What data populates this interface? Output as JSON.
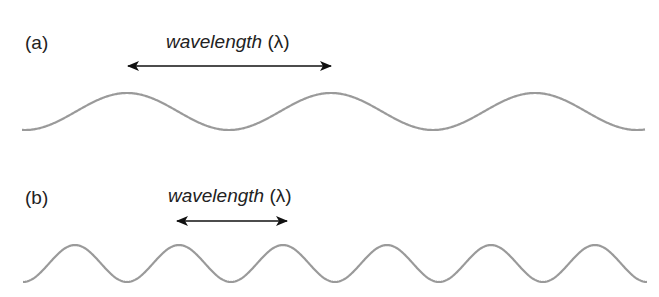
{
  "figure": {
    "colors": {
      "wave": "#9a9a9a",
      "arrow": "#111111",
      "text": "#222222"
    },
    "panels": [
      {
        "label": "(a)",
        "wavelength_text": "wavelength",
        "wavelength_symbol": "(λ)",
        "wave": {
          "x_start": 22,
          "x_end": 645,
          "y_peak": 93,
          "y_trough": 130,
          "period_px": 204,
          "first_peak_x": 127
        },
        "arrow": {
          "x1": 128,
          "x2": 331,
          "y": 66
        }
      },
      {
        "label": "(b)",
        "wavelength_text": "wavelength",
        "wavelength_symbol": "(λ)",
        "wave": {
          "x_start": 23,
          "x_end": 647,
          "y_peak": 245,
          "y_trough": 282,
          "period_px": 104,
          "first_peak_x": 75
        },
        "arrow": {
          "x1": 177,
          "x2": 287,
          "y": 221
        }
      }
    ]
  }
}
